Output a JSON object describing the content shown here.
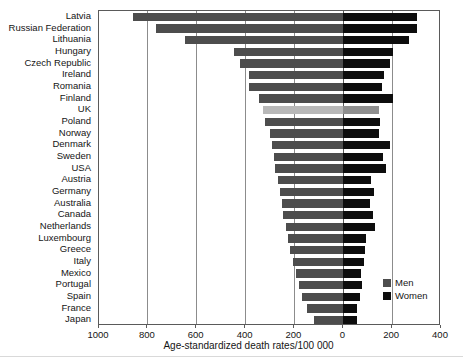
{
  "chart_data": {
    "type": "bar",
    "orientation": "horizontal",
    "style": "diverging-population-pyramid",
    "title": "",
    "subtitle": "",
    "xlabel": "Age-standardized death rates/100 000",
    "ylabel": "",
    "xlim": [
      -1000,
      400
    ],
    "xticks": [
      1000,
      800,
      600,
      400,
      200,
      0,
      200,
      400
    ],
    "xtick_positions": [
      -1000,
      -800,
      -600,
      -400,
      -200,
      0,
      200,
      400
    ],
    "grid": "vertical",
    "legend_position": "bottom-right",
    "categories": [
      "Latvia",
      "Russian Federation",
      "Lithuania",
      "Hungary",
      "Czech Republic",
      "Ireland",
      "Romania",
      "Finland",
      "UK",
      "Poland",
      "Norway",
      "Denmark",
      "Sweden",
      "USA",
      "Austria",
      "Germany",
      "Australia",
      "Canada",
      "Netherlands",
      "Luxembourg",
      "Greece",
      "Italy",
      "Mexico",
      "Portugal",
      "Spain",
      "France",
      "Japan"
    ],
    "highlight_category": "UK",
    "series": [
      {
        "name": "Men",
        "side": "left",
        "color": "#4d4d4d",
        "values": [
          860,
          765,
          650,
          448,
          423,
          385,
          385,
          345,
          330,
          320,
          300,
          292,
          285,
          278,
          268,
          260,
          252,
          245,
          235,
          228,
          218,
          205,
          192,
          180,
          168,
          150,
          118
        ]
      },
      {
        "name": "Women",
        "side": "right",
        "color": "#0d0d0d",
        "values": [
          300,
          300,
          268,
          202,
          193,
          168,
          157,
          205,
          145,
          152,
          148,
          192,
          162,
          175,
          112,
          125,
          108,
          120,
          130,
          95,
          88,
          85,
          72,
          78,
          70,
          58,
          55
        ]
      }
    ]
  },
  "legend": {
    "items": [
      {
        "label": "Men",
        "color": "#4d4d4d"
      },
      {
        "label": "Women",
        "color": "#0d0d0d"
      }
    ]
  },
  "axis": {
    "x_title": "Age-standardized death rates/100 000"
  }
}
